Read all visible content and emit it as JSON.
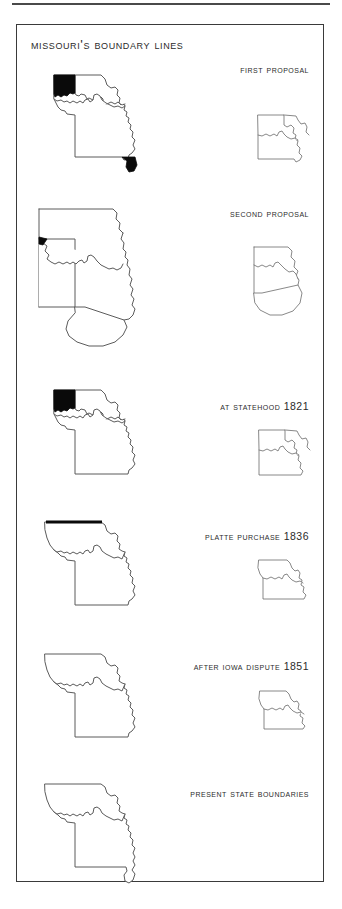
{
  "page": {
    "title": "Missouri's Boundary Lines",
    "background_color": "#ffffff",
    "frame_color": "#3a3a3a",
    "outline_color": "#5b5b5b",
    "highlight_color": "#0a0a0a"
  },
  "sections": [
    {
      "label": "First Proposal",
      "big_map_name": "missouri-map-first-proposal",
      "inset_map_name": "missouri-inset-first-proposal",
      "highlights": [
        "northwest-platte-wedge",
        "southeast-bootheel"
      ]
    },
    {
      "label": "Second Proposal",
      "big_map_name": "missouri-map-second-proposal",
      "inset_map_name": "missouri-inset-second-proposal",
      "highlights": [
        "northwest-notch"
      ]
    },
    {
      "label": "At Statehood 1821",
      "big_map_name": "missouri-map-at-statehood",
      "inset_map_name": "missouri-inset-at-statehood",
      "highlights": [
        "northwest-platte-wedge"
      ]
    },
    {
      "label": "Platte Purchase 1836",
      "big_map_name": "missouri-map-platte-purchase",
      "inset_map_name": "missouri-inset-platte-purchase",
      "highlights": [
        "northern-boundary-line"
      ]
    },
    {
      "label": "After Iowa Dispute 1851",
      "big_map_name": "missouri-map-after-iowa-dispute",
      "inset_map_name": "missouri-inset-after-iowa-dispute",
      "highlights": []
    },
    {
      "label": "Present State Boundaries",
      "big_map_name": "missouri-map-present-boundaries",
      "inset_map_name": null,
      "highlights": []
    }
  ]
}
